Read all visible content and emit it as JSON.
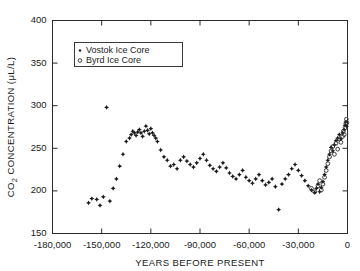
{
  "chart_data": {
    "type": "scatter",
    "title": "",
    "xlabel": "YEARS BEFORE PRESENT",
    "ylabel": "CO2 CONCENTRATION (μL/L)",
    "ylabel_parts": {
      "pre": "CO",
      "sub": "2",
      "post": " CONCENTRATION (μL/L)"
    },
    "xlim": [
      -180000,
      0
    ],
    "ylim": [
      150,
      400
    ],
    "xticks": [
      -180000,
      -150000,
      -120000,
      -90000,
      -60000,
      -30000,
      0
    ],
    "xtick_labels": [
      "-180,000",
      "-150,000",
      "-120,000",
      "-90,000",
      "-60,000",
      "-30,000",
      "0"
    ],
    "yticks": [
      150,
      200,
      250,
      300,
      350,
      400
    ],
    "ytick_labels": [
      "150",
      "200",
      "250",
      "300",
      "350",
      "400"
    ],
    "grid": false,
    "frame": "box",
    "tick_direction": "in",
    "legend": {
      "position": "upper-left-inset",
      "entries": [
        {
          "name": "Vostok Ice Core",
          "marker": "filled-dot",
          "color": "#1a1a1a"
        },
        {
          "name": "Byrd Ice Core",
          "marker": "open-circle",
          "color": "#2a2a2a"
        }
      ]
    },
    "series": [
      {
        "name": "Vostok Ice Core",
        "marker": "filled-dot",
        "color": "#1a1a1a",
        "points": [
          [
            -158000,
            186
          ],
          [
            -156000,
            191
          ],
          [
            -153000,
            190
          ],
          [
            -151000,
            183
          ],
          [
            -149000,
            193
          ],
          [
            -147000,
            298
          ],
          [
            -145000,
            188
          ],
          [
            -143000,
            203
          ],
          [
            -141000,
            214
          ],
          [
            -139000,
            229
          ],
          [
            -137000,
            243
          ],
          [
            -135000,
            258
          ],
          [
            -133000,
            262
          ],
          [
            -132000,
            266
          ],
          [
            -131000,
            270
          ],
          [
            -130000,
            268
          ],
          [
            -129000,
            265
          ],
          [
            -128000,
            269
          ],
          [
            -127000,
            272
          ],
          [
            -126000,
            268
          ],
          [
            -125000,
            264
          ],
          [
            -124000,
            270
          ],
          [
            -123000,
            276
          ],
          [
            -122000,
            271
          ],
          [
            -121000,
            267
          ],
          [
            -120000,
            273
          ],
          [
            -119000,
            268
          ],
          [
            -118000,
            265
          ],
          [
            -117000,
            262
          ],
          [
            -116000,
            258
          ],
          [
            -114000,
            248
          ],
          [
            -112000,
            240
          ],
          [
            -110000,
            236
          ],
          [
            -108000,
            229
          ],
          [
            -106000,
            231
          ],
          [
            -104000,
            226
          ],
          [
            -102000,
            236
          ],
          [
            -100000,
            240
          ],
          [
            -98000,
            235
          ],
          [
            -96000,
            231
          ],
          [
            -94000,
            228
          ],
          [
            -92000,
            233
          ],
          [
            -90000,
            238
          ],
          [
            -88000,
            243
          ],
          [
            -86000,
            236
          ],
          [
            -84000,
            230
          ],
          [
            -82000,
            226
          ],
          [
            -80000,
            223
          ],
          [
            -78000,
            228
          ],
          [
            -76000,
            233
          ],
          [
            -74000,
            227
          ],
          [
            -72000,
            221
          ],
          [
            -70000,
            217
          ],
          [
            -68000,
            214
          ],
          [
            -66000,
            219
          ],
          [
            -64000,
            224
          ],
          [
            -62000,
            216
          ],
          [
            -60000,
            212
          ],
          [
            -58000,
            209
          ],
          [
            -56000,
            214
          ],
          [
            -54000,
            219
          ],
          [
            -52000,
            212
          ],
          [
            -50000,
            207
          ],
          [
            -48000,
            210
          ],
          [
            -46000,
            214
          ],
          [
            -44000,
            205
          ],
          [
            -42000,
            178
          ],
          [
            -40000,
            208
          ],
          [
            -38000,
            214
          ],
          [
            -36000,
            219
          ],
          [
            -34000,
            226
          ],
          [
            -32000,
            231
          ],
          [
            -30000,
            224
          ],
          [
            -28000,
            218
          ],
          [
            -26000,
            212
          ],
          [
            -24000,
            206
          ],
          [
            -22000,
            201
          ],
          [
            -20000,
            198
          ],
          [
            -19000,
            203
          ],
          [
            -18000,
            208
          ],
          [
            -17000,
            199
          ],
          [
            -16000,
            204
          ],
          [
            -15000,
            211
          ],
          [
            -14000,
            219
          ],
          [
            -13000,
            228
          ],
          [
            -12000,
            236
          ],
          [
            -11000,
            243
          ],
          [
            -10000,
            251
          ],
          [
            -9000,
            247
          ],
          [
            -8000,
            254
          ],
          [
            -7000,
            259
          ],
          [
            -6000,
            262
          ],
          [
            -5000,
            266
          ],
          [
            -4000,
            261
          ],
          [
            -3000,
            268
          ],
          [
            -2000,
            272
          ],
          [
            -1500,
            277
          ],
          [
            -1000,
            281
          ],
          [
            -500,
            276
          ]
        ]
      },
      {
        "name": "Byrd Ice Core",
        "marker": "open-circle",
        "color": "#2a2a2a",
        "points": [
          [
            -22000,
            203
          ],
          [
            -20000,
            199
          ],
          [
            -18000,
            206
          ],
          [
            -17000,
            212
          ],
          [
            -16000,
            201
          ],
          [
            -15000,
            208
          ],
          [
            -14000,
            216
          ],
          [
            -13000,
            224
          ],
          [
            -12000,
            232
          ],
          [
            -11000,
            240
          ],
          [
            -10000,
            247
          ],
          [
            -9000,
            252
          ],
          [
            -8000,
            243
          ],
          [
            -7000,
            256
          ],
          [
            -6000,
            249
          ],
          [
            -5000,
            261
          ],
          [
            -4000,
            257
          ],
          [
            -3000,
            264
          ],
          [
            -2500,
            270
          ],
          [
            -2000,
            266
          ],
          [
            -1500,
            274
          ],
          [
            -1000,
            279
          ],
          [
            -700,
            284
          ],
          [
            -400,
            280
          ]
        ]
      }
    ]
  }
}
